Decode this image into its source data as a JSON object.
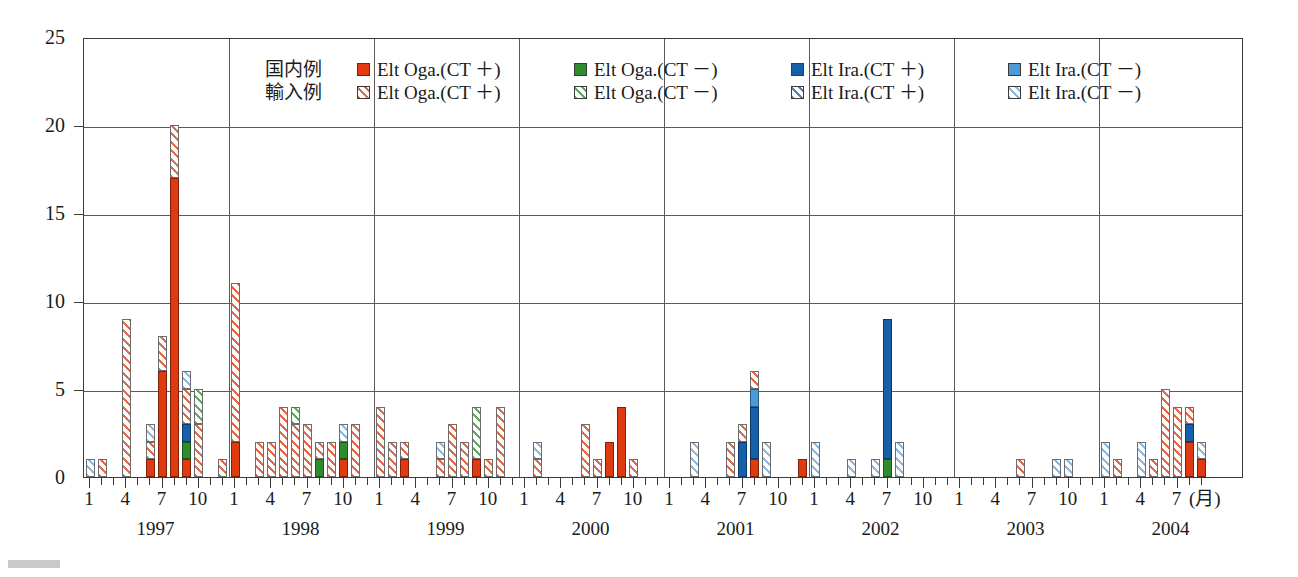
{
  "chart_data": {
    "type": "bar",
    "stacked": true,
    "title": "",
    "xlabel": "(月)",
    "ylabel": "",
    "ylim": [
      0,
      25
    ],
    "ytick_step": 5,
    "yticks": [
      0,
      5,
      10,
      15,
      20,
      25
    ],
    "grid": true,
    "legend_position": "top-center",
    "years": [
      "1997",
      "1998",
      "1999",
      "2000",
      "2001",
      "2002",
      "2003",
      "2004"
    ],
    "month_ticks": [
      "1",
      "4",
      "7",
      "10"
    ],
    "x_axis_end_month": 7,
    "series": [
      {
        "name": "Elt Oga.(CT ＋)",
        "group": "国内例",
        "key": "dom_oga_pos",
        "style": "solid",
        "color": "#e03a10"
      },
      {
        "name": "Elt Oga.(CT －)",
        "group": "国内例",
        "key": "dom_oga_neg",
        "style": "solid",
        "color": "#2e8b2e"
      },
      {
        "name": "Elt Ira.(CT ＋)",
        "group": "国内例",
        "key": "dom_ira_pos",
        "style": "solid",
        "color": "#1560a8"
      },
      {
        "name": "Elt Ira.(CT －)",
        "group": "国内例",
        "key": "dom_ira_neg",
        "style": "solid",
        "color": "#4e9ad6"
      },
      {
        "name": "Elt Oga.(CT ＋)",
        "group": "輸入例",
        "key": "imp_oga_pos",
        "style": "hatched",
        "color": "#e06a4a"
      },
      {
        "name": "Elt Oga.(CT －)",
        "group": "輸入例",
        "key": "imp_oga_neg",
        "style": "hatched",
        "color": "#63a863"
      },
      {
        "name": "Elt Ira.(CT ＋)",
        "group": "輸入例",
        "key": "imp_ira_pos",
        "style": "hatched",
        "color": "#5580b8"
      },
      {
        "name": "Elt Ira.(CT －)",
        "group": "輸入例",
        "key": "imp_ira_neg",
        "style": "hatched",
        "color": "#8fb8dd"
      }
    ],
    "bars": [
      {
        "year": 1997,
        "month": 1,
        "dom_oga_pos": 0,
        "dom_oga_neg": 0,
        "dom_ira_pos": 0,
        "dom_ira_neg": 0,
        "imp_oga_pos": 0,
        "imp_oga_neg": 0,
        "imp_ira_pos": 0,
        "imp_ira_neg": 1
      },
      {
        "year": 1997,
        "month": 2,
        "dom_oga_pos": 0,
        "dom_oga_neg": 0,
        "dom_ira_pos": 0,
        "dom_ira_neg": 0,
        "imp_oga_pos": 1,
        "imp_oga_neg": 0,
        "imp_ira_pos": 0,
        "imp_ira_neg": 0
      },
      {
        "year": 1997,
        "month": 4,
        "dom_oga_pos": 0,
        "dom_oga_neg": 0,
        "dom_ira_pos": 0,
        "dom_ira_neg": 0,
        "imp_oga_pos": 9,
        "imp_oga_neg": 0,
        "imp_ira_pos": 0,
        "imp_ira_neg": 0
      },
      {
        "year": 1997,
        "month": 6,
        "dom_oga_pos": 1,
        "dom_oga_neg": 0,
        "dom_ira_pos": 0,
        "dom_ira_neg": 0,
        "imp_oga_pos": 1,
        "imp_oga_neg": 0,
        "imp_ira_pos": 0,
        "imp_ira_neg": 1
      },
      {
        "year": 1997,
        "month": 7,
        "dom_oga_pos": 6,
        "dom_oga_neg": 0,
        "dom_ira_pos": 0,
        "dom_ira_neg": 0,
        "imp_oga_pos": 2,
        "imp_oga_neg": 0,
        "imp_ira_pos": 0,
        "imp_ira_neg": 0
      },
      {
        "year": 1997,
        "month": 8,
        "dom_oga_pos": 17,
        "dom_oga_neg": 0,
        "dom_ira_pos": 0,
        "dom_ira_neg": 0,
        "imp_oga_pos": 3,
        "imp_oga_neg": 0,
        "imp_ira_pos": 0,
        "imp_ira_neg": 0
      },
      {
        "year": 1997,
        "month": 9,
        "dom_oga_pos": 1,
        "dom_oga_neg": 1,
        "dom_ira_pos": 1,
        "dom_ira_neg": 0,
        "imp_oga_pos": 2,
        "imp_oga_neg": 0,
        "imp_ira_pos": 0,
        "imp_ira_neg": 1
      },
      {
        "year": 1997,
        "month": 10,
        "dom_oga_pos": 0,
        "dom_oga_neg": 0,
        "dom_ira_pos": 0,
        "dom_ira_neg": 0,
        "imp_oga_pos": 3,
        "imp_oga_neg": 2,
        "imp_ira_pos": 0,
        "imp_ira_neg": 0
      },
      {
        "year": 1997,
        "month": 12,
        "dom_oga_pos": 0,
        "dom_oga_neg": 0,
        "dom_ira_pos": 0,
        "dom_ira_neg": 0,
        "imp_oga_pos": 1,
        "imp_oga_neg": 0,
        "imp_ira_pos": 0,
        "imp_ira_neg": 0
      },
      {
        "year": 1998,
        "month": 1,
        "dom_oga_pos": 2,
        "dom_oga_neg": 0,
        "dom_ira_pos": 0,
        "dom_ira_neg": 0,
        "imp_oga_pos": 9,
        "imp_oga_neg": 0,
        "imp_ira_pos": 0,
        "imp_ira_neg": 0
      },
      {
        "year": 1998,
        "month": 3,
        "dom_oga_pos": 0,
        "dom_oga_neg": 0,
        "dom_ira_pos": 0,
        "dom_ira_neg": 0,
        "imp_oga_pos": 2,
        "imp_oga_neg": 0,
        "imp_ira_pos": 0,
        "imp_ira_neg": 0
      },
      {
        "year": 1998,
        "month": 4,
        "dom_oga_pos": 0,
        "dom_oga_neg": 0,
        "dom_ira_pos": 0,
        "dom_ira_neg": 0,
        "imp_oga_pos": 2,
        "imp_oga_neg": 0,
        "imp_ira_pos": 0,
        "imp_ira_neg": 0
      },
      {
        "year": 1998,
        "month": 5,
        "dom_oga_pos": 0,
        "dom_oga_neg": 0,
        "dom_ira_pos": 0,
        "dom_ira_neg": 0,
        "imp_oga_pos": 4,
        "imp_oga_neg": 0,
        "imp_ira_pos": 0,
        "imp_ira_neg": 0
      },
      {
        "year": 1998,
        "month": 6,
        "dom_oga_pos": 0,
        "dom_oga_neg": 0,
        "dom_ira_pos": 0,
        "dom_ira_neg": 0,
        "imp_oga_pos": 3,
        "imp_oga_neg": 1,
        "imp_ira_pos": 0,
        "imp_ira_neg": 0
      },
      {
        "year": 1998,
        "month": 7,
        "dom_oga_pos": 0,
        "dom_oga_neg": 0,
        "dom_ira_pos": 0,
        "dom_ira_neg": 0,
        "imp_oga_pos": 3,
        "imp_oga_neg": 0,
        "imp_ira_pos": 0,
        "imp_ira_neg": 0
      },
      {
        "year": 1998,
        "month": 8,
        "dom_oga_pos": 0,
        "dom_oga_neg": 1,
        "dom_ira_pos": 0,
        "dom_ira_neg": 0,
        "imp_oga_pos": 1,
        "imp_oga_neg": 0,
        "imp_ira_pos": 0,
        "imp_ira_neg": 0
      },
      {
        "year": 1998,
        "month": 9,
        "dom_oga_pos": 0,
        "dom_oga_neg": 0,
        "dom_ira_pos": 0,
        "dom_ira_neg": 0,
        "imp_oga_pos": 2,
        "imp_oga_neg": 0,
        "imp_ira_pos": 0,
        "imp_ira_neg": 0
      },
      {
        "year": 1998,
        "month": 10,
        "dom_oga_pos": 1,
        "dom_oga_neg": 1,
        "dom_ira_pos": 0,
        "dom_ira_neg": 0,
        "imp_oga_pos": 0,
        "imp_oga_neg": 0,
        "imp_ira_pos": 0,
        "imp_ira_neg": 1
      },
      {
        "year": 1998,
        "month": 11,
        "dom_oga_pos": 0,
        "dom_oga_neg": 0,
        "dom_ira_pos": 0,
        "dom_ira_neg": 0,
        "imp_oga_pos": 3,
        "imp_oga_neg": 0,
        "imp_ira_pos": 0,
        "imp_ira_neg": 0
      },
      {
        "year": 1999,
        "month": 1,
        "dom_oga_pos": 0,
        "dom_oga_neg": 0,
        "dom_ira_pos": 0,
        "dom_ira_neg": 0,
        "imp_oga_pos": 4,
        "imp_oga_neg": 0,
        "imp_ira_pos": 0,
        "imp_ira_neg": 0
      },
      {
        "year": 1999,
        "month": 2,
        "dom_oga_pos": 0,
        "dom_oga_neg": 0,
        "dom_ira_pos": 0,
        "dom_ira_neg": 0,
        "imp_oga_pos": 2,
        "imp_oga_neg": 0,
        "imp_ira_pos": 0,
        "imp_ira_neg": 0
      },
      {
        "year": 1999,
        "month": 3,
        "dom_oga_pos": 1,
        "dom_oga_neg": 0,
        "dom_ira_pos": 0,
        "dom_ira_neg": 0,
        "imp_oga_pos": 1,
        "imp_oga_neg": 0,
        "imp_ira_pos": 0,
        "imp_ira_neg": 0
      },
      {
        "year": 1999,
        "month": 6,
        "dom_oga_pos": 0,
        "dom_oga_neg": 0,
        "dom_ira_pos": 0,
        "dom_ira_neg": 0,
        "imp_oga_pos": 1,
        "imp_oga_neg": 0,
        "imp_ira_pos": 0,
        "imp_ira_neg": 1
      },
      {
        "year": 1999,
        "month": 7,
        "dom_oga_pos": 0,
        "dom_oga_neg": 0,
        "dom_ira_pos": 0,
        "dom_ira_neg": 0,
        "imp_oga_pos": 3,
        "imp_oga_neg": 0,
        "imp_ira_pos": 0,
        "imp_ira_neg": 0
      },
      {
        "year": 1999,
        "month": 8,
        "dom_oga_pos": 0,
        "dom_oga_neg": 0,
        "dom_ira_pos": 0,
        "dom_ira_neg": 0,
        "imp_oga_pos": 2,
        "imp_oga_neg": 0,
        "imp_ira_pos": 0,
        "imp_ira_neg": 0
      },
      {
        "year": 1999,
        "month": 9,
        "dom_oga_pos": 1,
        "dom_oga_neg": 0,
        "dom_ira_pos": 0,
        "dom_ira_neg": 0,
        "imp_oga_pos": 0,
        "imp_oga_neg": 3,
        "imp_ira_pos": 0,
        "imp_ira_neg": 0
      },
      {
        "year": 1999,
        "month": 10,
        "dom_oga_pos": 0,
        "dom_oga_neg": 0,
        "dom_ira_pos": 0,
        "dom_ira_neg": 0,
        "imp_oga_pos": 1,
        "imp_oga_neg": 0,
        "imp_ira_pos": 0,
        "imp_ira_neg": 0
      },
      {
        "year": 1999,
        "month": 11,
        "dom_oga_pos": 0,
        "dom_oga_neg": 0,
        "dom_ira_pos": 0,
        "dom_ira_neg": 0,
        "imp_oga_pos": 4,
        "imp_oga_neg": 0,
        "imp_ira_pos": 0,
        "imp_ira_neg": 0
      },
      {
        "year": 2000,
        "month": 2,
        "dom_oga_pos": 0,
        "dom_oga_neg": 0,
        "dom_ira_pos": 0,
        "dom_ira_neg": 0,
        "imp_oga_pos": 1,
        "imp_oga_neg": 0,
        "imp_ira_pos": 0,
        "imp_ira_neg": 1
      },
      {
        "year": 2000,
        "month": 4,
        "dom_oga_pos": 0,
        "dom_oga_neg": 0,
        "dom_ira_pos": 0,
        "dom_ira_neg": 0,
        "imp_oga_pos": 0,
        "imp_oga_neg": 0,
        "imp_ira_pos": 0,
        "imp_ira_neg": 0
      },
      {
        "year": 2000,
        "month": 6,
        "dom_oga_pos": 0,
        "dom_oga_neg": 0,
        "dom_ira_pos": 0,
        "dom_ira_neg": 0,
        "imp_oga_pos": 3,
        "imp_oga_neg": 0,
        "imp_ira_pos": 0,
        "imp_ira_neg": 0
      },
      {
        "year": 2000,
        "month": 7,
        "dom_oga_pos": 0,
        "dom_oga_neg": 0,
        "dom_ira_pos": 0,
        "dom_ira_neg": 0,
        "imp_oga_pos": 1,
        "imp_oga_neg": 0,
        "imp_ira_pos": 0,
        "imp_ira_neg": 0
      },
      {
        "year": 2000,
        "month": 8,
        "dom_oga_pos": 2,
        "dom_oga_neg": 0,
        "dom_ira_pos": 0,
        "dom_ira_neg": 0,
        "imp_oga_pos": 0,
        "imp_oga_neg": 0,
        "imp_ira_pos": 0,
        "imp_ira_neg": 0
      },
      {
        "year": 2000,
        "month": 9,
        "dom_oga_pos": 4,
        "dom_oga_neg": 0,
        "dom_ira_pos": 0,
        "dom_ira_neg": 0,
        "imp_oga_pos": 0,
        "imp_oga_neg": 0,
        "imp_ira_pos": 0,
        "imp_ira_neg": 0
      },
      {
        "year": 2000,
        "month": 10,
        "dom_oga_pos": 0,
        "dom_oga_neg": 0,
        "dom_ira_pos": 0,
        "dom_ira_neg": 0,
        "imp_oga_pos": 1,
        "imp_oga_neg": 0,
        "imp_ira_pos": 0,
        "imp_ira_neg": 0
      },
      {
        "year": 2001,
        "month": 3,
        "dom_oga_pos": 0,
        "dom_oga_neg": 0,
        "dom_ira_pos": 0,
        "dom_ira_neg": 0,
        "imp_oga_pos": 0,
        "imp_oga_neg": 0,
        "imp_ira_pos": 0,
        "imp_ira_neg": 2
      },
      {
        "year": 2001,
        "month": 6,
        "dom_oga_pos": 0,
        "dom_oga_neg": 0,
        "dom_ira_pos": 0,
        "dom_ira_neg": 0,
        "imp_oga_pos": 2,
        "imp_oga_neg": 0,
        "imp_ira_pos": 0,
        "imp_ira_neg": 0
      },
      {
        "year": 2001,
        "month": 7,
        "dom_oga_pos": 0,
        "dom_oga_neg": 0,
        "dom_ira_pos": 2,
        "dom_ira_neg": 0,
        "imp_oga_pos": 1,
        "imp_oga_neg": 0,
        "imp_ira_pos": 0,
        "imp_ira_neg": 0
      },
      {
        "year": 2001,
        "month": 8,
        "dom_oga_pos": 1,
        "dom_oga_neg": 0,
        "dom_ira_pos": 3,
        "dom_ira_neg": 1,
        "imp_oga_pos": 1,
        "imp_oga_neg": 0,
        "imp_ira_pos": 0,
        "imp_ira_neg": 0
      },
      {
        "year": 2001,
        "month": 9,
        "dom_oga_pos": 0,
        "dom_oga_neg": 0,
        "dom_ira_pos": 0,
        "dom_ira_neg": 0,
        "imp_oga_pos": 0,
        "imp_oga_neg": 0,
        "imp_ira_pos": 0,
        "imp_ira_neg": 2
      },
      {
        "year": 2001,
        "month": 12,
        "dom_oga_pos": 1,
        "dom_oga_neg": 0,
        "dom_ira_pos": 0,
        "dom_ira_neg": 0,
        "imp_oga_pos": 0,
        "imp_oga_neg": 0,
        "imp_ira_pos": 0,
        "imp_ira_neg": 0
      },
      {
        "year": 2002,
        "month": 1,
        "dom_oga_pos": 0,
        "dom_oga_neg": 0,
        "dom_ira_pos": 0,
        "dom_ira_neg": 0,
        "imp_oga_pos": 0,
        "imp_oga_neg": 0,
        "imp_ira_pos": 0,
        "imp_ira_neg": 2
      },
      {
        "year": 2002,
        "month": 4,
        "dom_oga_pos": 0,
        "dom_oga_neg": 0,
        "dom_ira_pos": 0,
        "dom_ira_neg": 0,
        "imp_oga_pos": 0,
        "imp_oga_neg": 0,
        "imp_ira_pos": 0,
        "imp_ira_neg": 1
      },
      {
        "year": 2002,
        "month": 6,
        "dom_oga_pos": 0,
        "dom_oga_neg": 0,
        "dom_ira_pos": 0,
        "dom_ira_neg": 0,
        "imp_oga_pos": 0,
        "imp_oga_neg": 0,
        "imp_ira_pos": 0,
        "imp_ira_neg": 1
      },
      {
        "year": 2002,
        "month": 7,
        "dom_oga_pos": 0,
        "dom_oga_neg": 1,
        "dom_ira_pos": 8,
        "dom_ira_neg": 0,
        "imp_oga_pos": 0,
        "imp_oga_neg": 0,
        "imp_ira_pos": 0,
        "imp_ira_neg": 0
      },
      {
        "year": 2002,
        "month": 8,
        "dom_oga_pos": 0,
        "dom_oga_neg": 0,
        "dom_ira_pos": 0,
        "dom_ira_neg": 0,
        "imp_oga_pos": 0,
        "imp_oga_neg": 0,
        "imp_ira_pos": 0,
        "imp_ira_neg": 2
      },
      {
        "year": 2003,
        "month": 6,
        "dom_oga_pos": 0,
        "dom_oga_neg": 0,
        "dom_ira_pos": 0,
        "dom_ira_neg": 0,
        "imp_oga_pos": 1,
        "imp_oga_neg": 0,
        "imp_ira_pos": 0,
        "imp_ira_neg": 0
      },
      {
        "year": 2003,
        "month": 9,
        "dom_oga_pos": 0,
        "dom_oga_neg": 0,
        "dom_ira_pos": 0,
        "dom_ira_neg": 0,
        "imp_oga_pos": 0,
        "imp_oga_neg": 0,
        "imp_ira_pos": 0,
        "imp_ira_neg": 1
      },
      {
        "year": 2003,
        "month": 10,
        "dom_oga_pos": 0,
        "dom_oga_neg": 0,
        "dom_ira_pos": 0,
        "dom_ira_neg": 0,
        "imp_oga_pos": 0,
        "imp_oga_neg": 0,
        "imp_ira_pos": 0,
        "imp_ira_neg": 1
      },
      {
        "year": 2004,
        "month": 1,
        "dom_oga_pos": 0,
        "dom_oga_neg": 0,
        "dom_ira_pos": 0,
        "dom_ira_neg": 0,
        "imp_oga_pos": 0,
        "imp_oga_neg": 0,
        "imp_ira_pos": 0,
        "imp_ira_neg": 2
      },
      {
        "year": 2004,
        "month": 2,
        "dom_oga_pos": 0,
        "dom_oga_neg": 0,
        "dom_ira_pos": 0,
        "dom_ira_neg": 0,
        "imp_oga_pos": 1,
        "imp_oga_neg": 0,
        "imp_ira_pos": 0,
        "imp_ira_neg": 0
      },
      {
        "year": 2004,
        "month": 4,
        "dom_oga_pos": 0,
        "dom_oga_neg": 0,
        "dom_ira_pos": 0,
        "dom_ira_neg": 0,
        "imp_oga_pos": 0,
        "imp_oga_neg": 0,
        "imp_ira_pos": 0,
        "imp_ira_neg": 2
      },
      {
        "year": 2004,
        "month": 5,
        "dom_oga_pos": 0,
        "dom_oga_neg": 0,
        "dom_ira_pos": 0,
        "dom_ira_neg": 0,
        "imp_oga_pos": 1,
        "imp_oga_neg": 0,
        "imp_ira_pos": 0,
        "imp_ira_neg": 0
      },
      {
        "year": 2004,
        "month": 6,
        "dom_oga_pos": 0,
        "dom_oga_neg": 0,
        "dom_ira_pos": 0,
        "dom_ira_neg": 0,
        "imp_oga_pos": 5,
        "imp_oga_neg": 0,
        "imp_ira_pos": 0,
        "imp_ira_neg": 0
      },
      {
        "year": 2004,
        "month": 7,
        "dom_oga_pos": 0,
        "dom_oga_neg": 0,
        "dom_ira_pos": 0,
        "dom_ira_neg": 0,
        "imp_oga_pos": 4,
        "imp_oga_neg": 0,
        "imp_ira_pos": 0,
        "imp_ira_neg": 0
      },
      {
        "year": 2004,
        "month": 8,
        "dom_oga_pos": 2,
        "dom_oga_neg": 0,
        "dom_ira_pos": 1,
        "dom_ira_neg": 0,
        "imp_oga_pos": 1,
        "imp_oga_neg": 0,
        "imp_ira_pos": 0,
        "imp_ira_neg": 0
      },
      {
        "year": 2004,
        "month": 9,
        "dom_oga_pos": 1,
        "dom_oga_neg": 0,
        "dom_ira_pos": 0,
        "dom_ira_neg": 0,
        "imp_oga_pos": 0,
        "imp_oga_neg": 0,
        "imp_ira_pos": 0,
        "imp_ira_neg": 1
      }
    ]
  },
  "legend": {
    "row_labels": [
      "国内例",
      "輸入例"
    ],
    "domestic": [
      "Elt Oga.(CT ＋)",
      "Elt Oga.(CT －)",
      "Elt Ira.(CT ＋)",
      "Elt Ira.(CT －)"
    ],
    "imported": [
      "Elt Oga.(CT ＋)",
      "Elt Oga.(CT －)",
      "Elt Ira.(CT ＋)",
      "Elt Ira.(CT －)"
    ]
  }
}
